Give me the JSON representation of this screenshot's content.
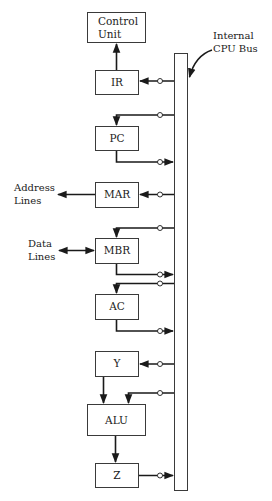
{
  "diagram": {
    "bus_label": {
      "line1": "Internal",
      "line2": "CPU Bus"
    },
    "blocks": {
      "control_unit": {
        "line1": "Control",
        "line2": "Unit"
      },
      "ir": {
        "label": "IR"
      },
      "pc": {
        "label": "PC"
      },
      "mar": {
        "label": "MAR"
      },
      "mbr": {
        "label": "MBR"
      },
      "ac": {
        "label": "AC"
      },
      "y": {
        "label": "Y"
      },
      "alu": {
        "label": "ALU"
      },
      "z": {
        "label": "Z"
      }
    },
    "external": {
      "address_lines": {
        "line1": "Address",
        "line2": "Lines"
      },
      "data_lines": {
        "line1": "Data",
        "line2": "Lines"
      }
    },
    "connections": [
      {
        "from": "IR",
        "to": "Control Unit",
        "type": "arrow"
      },
      {
        "from": "Bus",
        "to": "IR",
        "type": "gated"
      },
      {
        "from": "Bus",
        "to": "PC",
        "type": "gated"
      },
      {
        "from": "PC",
        "to": "Bus",
        "type": "gated"
      },
      {
        "from": "Bus",
        "to": "MAR",
        "type": "gated"
      },
      {
        "from": "MAR",
        "to": "Address Lines",
        "type": "arrow"
      },
      {
        "from": "Bus",
        "to": "MBR",
        "type": "gated"
      },
      {
        "from": "MBR",
        "to": "Bus",
        "type": "gated"
      },
      {
        "from": "Data Lines",
        "to": "MBR",
        "type": "bidirectional"
      },
      {
        "from": "Bus",
        "to": "AC",
        "type": "gated"
      },
      {
        "from": "AC",
        "to": "Bus",
        "type": "gated"
      },
      {
        "from": "Bus",
        "to": "Y",
        "type": "gated"
      },
      {
        "from": "Y",
        "to": "ALU",
        "type": "arrow"
      },
      {
        "from": "Bus",
        "to": "ALU",
        "type": "gated"
      },
      {
        "from": "ALU",
        "to": "Z",
        "type": "arrow"
      },
      {
        "from": "Z",
        "to": "Bus",
        "type": "gated"
      }
    ],
    "colors": {
      "line": "#1a1a1a",
      "box_stroke": "#3a3a3a",
      "background": "#ffffff"
    }
  }
}
